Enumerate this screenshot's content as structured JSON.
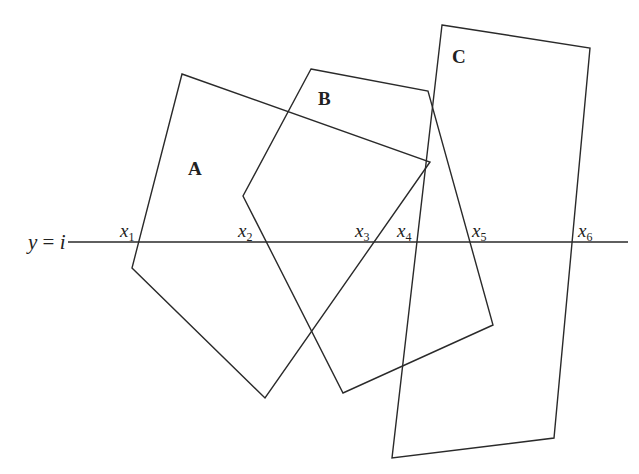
{
  "diagram": {
    "stroke_color": "#2a2a2a",
    "background": "#ffffff",
    "scanline": {
      "label_var": "y",
      "label_eq": " = ",
      "label_val": "i",
      "y": 242,
      "x_start": 68,
      "x_end": 628
    },
    "polygons": [
      {
        "name": "A",
        "label": "A",
        "label_pos": [
          188,
          175
        ],
        "points": "182,74 430,162 265,398 132,268"
      },
      {
        "name": "B",
        "label": "B",
        "label_pos": [
          318,
          105
        ],
        "points": "311,69 428,91 493,325 343,393 243,196"
      },
      {
        "name": "C",
        "label": "C",
        "label_pos": [
          452,
          63
        ],
        "points": "442,25 590,48 554,438 392,458"
      }
    ],
    "intersections": [
      {
        "var": "x",
        "sub": "1",
        "pos": [
          120,
          237
        ]
      },
      {
        "var": "x",
        "sub": "2",
        "pos": [
          240,
          237
        ]
      },
      {
        "var": "x",
        "sub": "3",
        "pos": [
          356,
          237
        ]
      },
      {
        "var": "x",
        "sub": "4",
        "pos": [
          398,
          237
        ]
      },
      {
        "var": "x",
        "sub": "5",
        "pos": [
          472,
          237
        ]
      },
      {
        "var": "x",
        "sub": "6",
        "pos": [
          578,
          237
        ]
      }
    ]
  }
}
